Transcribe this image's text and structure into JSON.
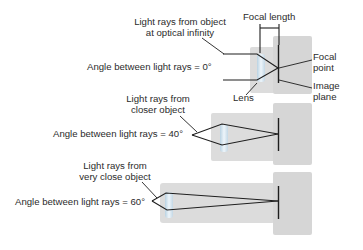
{
  "diagram": {
    "panels": [
      {
        "id": "infinity",
        "source_label": [
          "Light rays from object",
          "at optical infinity"
        ],
        "angle_label": "Angle between light rays = 0°",
        "angle_deg": 0
      },
      {
        "id": "closer",
        "source_label": [
          "Light rays from",
          "closer object"
        ],
        "angle_label": "Angle between light rays = 40°",
        "angle_deg": 40
      },
      {
        "id": "very-close",
        "source_label": [
          "Light rays from",
          "very close object"
        ],
        "angle_label": "Angle between light rays = 60°",
        "angle_deg": 60
      }
    ],
    "callouts": {
      "focal_length": "Focal length",
      "focal_point": [
        "Focal",
        "point"
      ],
      "image_plane": [
        "Image",
        "plane"
      ],
      "lens": "Lens"
    },
    "colors": {
      "body": "#d9d9d9",
      "lens": "#cfe2ee",
      "line": "#1e1e1e",
      "text": "#2b2b2b"
    }
  }
}
